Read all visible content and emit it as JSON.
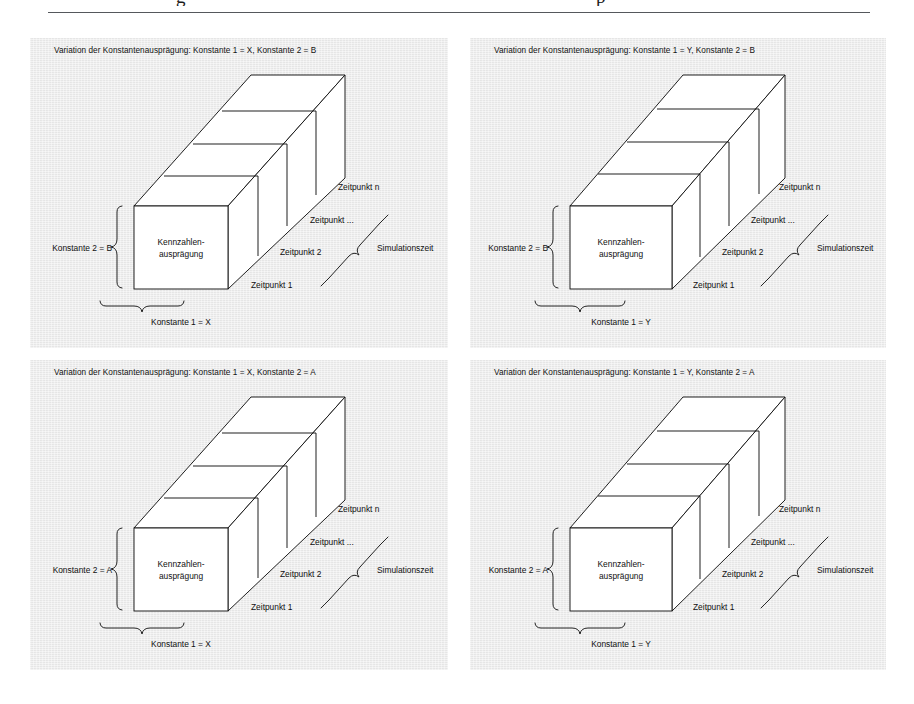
{
  "page": {
    "header_remnant_left": "g",
    "header_remnant_right": "p",
    "background_color": "#ffffff",
    "panel_background_color": "#ececec",
    "line_color": "#141414"
  },
  "figure": {
    "panel_count": 4,
    "panels": [
      {
        "id": "panel-top-left",
        "title": "Variation der Konstantenausprägung: Konstante 1 = X, Konstante 2 = B",
        "front_face_label_line1": "Kennzahlen-",
        "front_face_label_line2": "ausprägung",
        "left_brace_label": "Konstante 2 = B",
        "bottom_brace_label": "Konstante 1 = X",
        "right_brace_label": "Simulationszeit",
        "slab_labels": [
          "Zeitpunkt 1",
          "Zeitpunkt 2",
          "Zeitpunkt ...",
          "Zeitpunkt n"
        ],
        "slab_count": 4,
        "konstante_1_value": "X",
        "konstante_2_value": "B",
        "front_width": 94
      },
      {
        "id": "panel-top-right",
        "title": "Variation der Konstantenausprägung: Konstante 1 = Y, Konstante 2 = B",
        "front_face_label_line1": "Kennzahlen-",
        "front_face_label_line2": "ausprägung",
        "left_brace_label": "Konstante 2 = B",
        "bottom_brace_label": "Konstante 1 = Y",
        "right_brace_label": "Simulationszeit",
        "slab_labels": [
          "Zeitpunkt 1",
          "Zeitpunkt 2",
          "Zeitpunkt ...",
          "Zeitpunkt n"
        ],
        "slab_count": 4,
        "konstante_1_value": "Y",
        "konstante_2_value": "B",
        "front_width": 102
      },
      {
        "id": "panel-bottom-left",
        "title": "Variation der Konstantenausprägung: Konstante 1 = X, Konstante 2 = A",
        "front_face_label_line1": "Kennzahlen-",
        "front_face_label_line2": "ausprägung",
        "left_brace_label": "Konstante 2 = A",
        "bottom_brace_label": "Konstante 1 = X",
        "right_brace_label": "Simulationszeit",
        "slab_labels": [
          "Zeitpunkt 1",
          "Zeitpunkt 2",
          "Zeitpunkt ...",
          "Zeitpunkt n"
        ],
        "slab_count": 4,
        "konstante_1_value": "X",
        "konstante_2_value": "A",
        "front_width": 94
      },
      {
        "id": "panel-bottom-right",
        "title": "Variation der Konstantenausprägung: Konstante 1 = Y, Konstante 2 = A",
        "front_face_label_line1": "Kennzahlen-",
        "front_face_label_line2": "ausprägung",
        "left_brace_label": "Konstante 2 = A",
        "bottom_brace_label": "Konstante 1 = Y",
        "right_brace_label": "Simulationszeit",
        "slab_labels": [
          "Zeitpunkt 1",
          "Zeitpunkt 2",
          "Zeitpunkt ...",
          "Zeitpunkt n"
        ],
        "slab_count": 4,
        "konstante_1_value": "Y",
        "konstante_2_value": "A",
        "front_width": 102
      }
    ]
  }
}
